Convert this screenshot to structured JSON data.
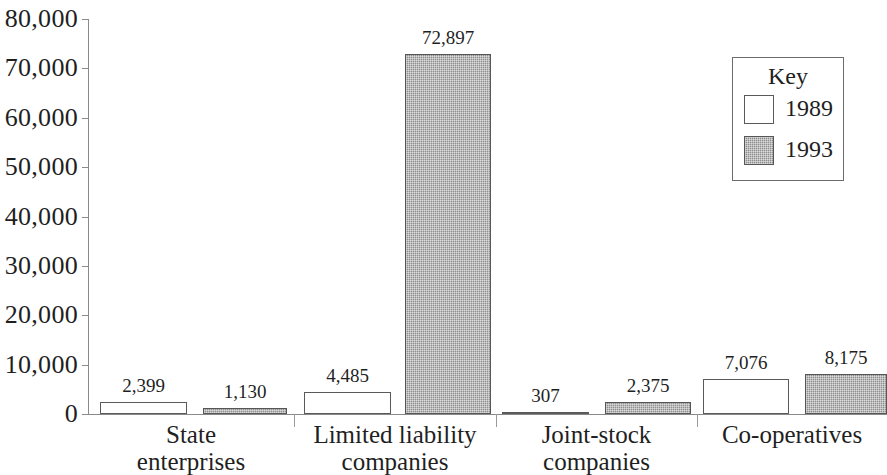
{
  "chart_data": {
    "type": "bar",
    "title": "",
    "subtitle": "",
    "xlabel": "",
    "ylabel": "",
    "categories": [
      "State enterprises",
      "Limited liability companies",
      "Joint-stock companies",
      "Co-operatives"
    ],
    "category_lines": [
      [
        "State",
        "enterprises"
      ],
      [
        "Limited liability",
        "companies"
      ],
      [
        "Joint-stock",
        "companies"
      ],
      [
        "Co-operatives"
      ]
    ],
    "series": [
      {
        "name": "1989",
        "values": [
          2399,
          1130,
          4485,
          307
        ],
        "values_by_category": {
          "State enterprises": 2399,
          "Limited liability companies": 4485,
          "Joint-stock companies": 307,
          "Co-operatives": 7076
        },
        "fill": "white",
        "color": "#ffffff"
      },
      {
        "name": "1993",
        "values_by_category": {
          "State enterprises": 1130,
          "Limited liability companies": 72897,
          "Joint-stock companies": 2375,
          "Co-operatives": 8175
        },
        "fill": "hatched-gray",
        "color": "#8e8e8e"
      }
    ],
    "bars": [
      {
        "category": "State enterprises",
        "series": "1989",
        "value": 2399,
        "label": "2,399"
      },
      {
        "category": "State enterprises",
        "series": "1993",
        "value": 1130,
        "label": "1,130"
      },
      {
        "category": "Limited liability companies",
        "series": "1989",
        "value": 4485,
        "label": "4,485"
      },
      {
        "category": "Limited liability companies",
        "series": "1993",
        "value": 72897,
        "label": "72,897"
      },
      {
        "category": "Joint-stock companies",
        "series": "1989",
        "value": 307,
        "label": "307"
      },
      {
        "category": "Joint-stock companies",
        "series": "1993",
        "value": 2375,
        "label": "2,375"
      },
      {
        "category": "Co-operatives",
        "series": "1989",
        "value": 7076,
        "label": "7,076"
      },
      {
        "category": "Co-operatives",
        "series": "1993",
        "value": 8175,
        "label": "8,175"
      }
    ],
    "ylim": [
      0,
      80000
    ],
    "ytick_values": [
      0,
      10000,
      20000,
      30000,
      40000,
      50000,
      60000,
      70000,
      80000
    ],
    "ytick_labels": [
      "0",
      "10,000",
      "20,000",
      "30,000",
      "40,000",
      "50,000",
      "60,000",
      "70,000",
      "80,000"
    ],
    "grid": false,
    "legend": {
      "title": "Key",
      "position": "top-right",
      "entries": [
        {
          "label": "1989",
          "fill": "white"
        },
        {
          "label": "1993",
          "fill": "hatched-gray"
        }
      ]
    }
  },
  "layout": {
    "axis": {
      "x0": 88,
      "y_top": 19,
      "y_zero": 414,
      "x_end": 887
    },
    "bar_geometry": [
      {
        "x": 100,
        "w": 87
      },
      {
        "x": 203,
        "w": 84
      },
      {
        "x": 304,
        "w": 87
      },
      {
        "x": 405,
        "w": 86
      },
      {
        "x": 502,
        "w": 87
      },
      {
        "x": 605,
        "w": 86
      },
      {
        "x": 703,
        "w": 86
      },
      {
        "x": 805,
        "w": 82
      }
    ],
    "dividers": [
      294,
      496,
      697
    ],
    "category_label_x": [
      88,
      294,
      496,
      697
    ],
    "category_label_w": [
      206,
      202,
      201,
      190
    ]
  }
}
